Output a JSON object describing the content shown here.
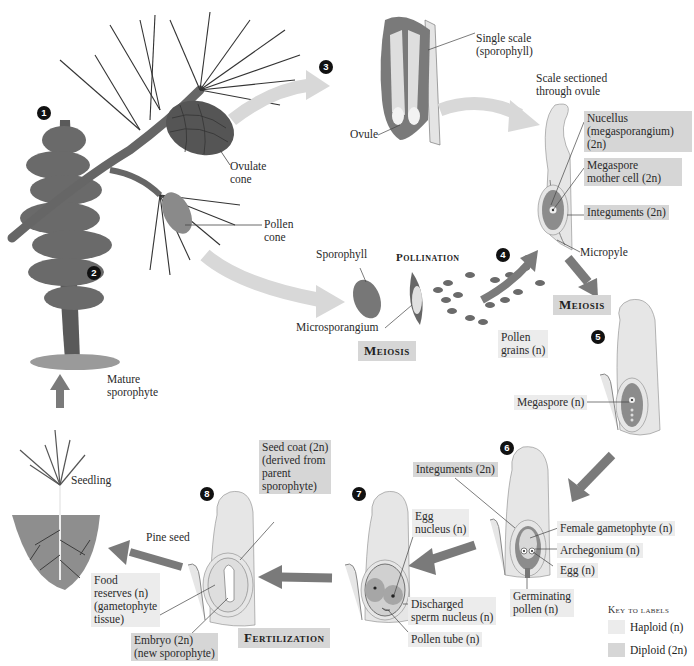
{
  "steps": [
    {
      "num": "1"
    },
    {
      "num": "2"
    },
    {
      "num": "3"
    },
    {
      "num": "4"
    },
    {
      "num": "5"
    },
    {
      "num": "6"
    },
    {
      "num": "7"
    },
    {
      "num": "8"
    }
  ],
  "labels": {
    "ovulate_cone": "Ovulate\ncone",
    "pollen_cone": "Pollen\ncone",
    "mature_sporophyte": "Mature\nsporophyte",
    "seedling": "Seedling",
    "single_scale": "Single scale\n(sporophyll)",
    "ovule": "Ovule",
    "scale_sectioned": "Scale sectioned\nthrough ovule",
    "nucellus": "Nucellus\n(megasporangium)\n(2n)",
    "megaspore_mother_cell": "Megaspore\nmother cell (2n)",
    "integuments_top": "Integuments (2n)",
    "micropyle": "Micropyle",
    "sporophyll": "Sporophyll",
    "microsporangium": "Microsporangium",
    "pollen_grains": "Pollen\ngrains (n)",
    "megaspore": "Megaspore (n)",
    "integuments_6": "Integuments (2n)",
    "female_gametophyte": "Female gametophyte (n)",
    "archegonium": "Archegonium (n)",
    "egg": "Egg (n)",
    "germinating_pollen": "Germinating\npollen (n)",
    "egg_nucleus": "Egg\nnucleus (n)",
    "discharged_sperm": "Discharged\nsperm nucleus (n)",
    "pollen_tube": "Pollen tube (n)",
    "seed_coat": "Seed coat (2n)\n(derived from\nparent\nsporophyte)",
    "pine_seed": "Pine seed",
    "food_reserves": "Food\nreserves (n)\n(gametophyte\ntissue)",
    "embryo": "Embryo (2n)\n(new sporophyte)"
  },
  "stages": {
    "pollination": "Pollination",
    "meiosis_left": "Meiosis",
    "meiosis_right": "Meiosis",
    "fertilization": "Fertilization"
  },
  "key": {
    "title": "Key to labels",
    "haploid_label": "Haploid (n)",
    "diploid_label": "Diploid (2n)",
    "haploid_color": "#ececec",
    "diploid_color": "#d6d6d6"
  },
  "colors": {
    "arrow_light": "#d8d8d8",
    "arrow_dark": "#7a7a7a",
    "tissue_fill": "#e6e6e6",
    "nucellus_fill": "#8c8c8c"
  }
}
